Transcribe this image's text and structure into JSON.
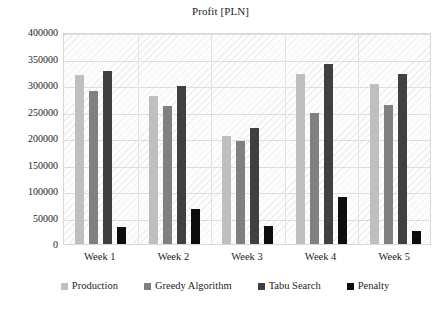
{
  "chart_data": {
    "type": "bar",
    "title": "Profit [PLN]",
    "xlabel": "",
    "ylabel": "",
    "categories": [
      "Week 1",
      "Week 2",
      "Week 3",
      "Week 4",
      "Week 5"
    ],
    "series": [
      {
        "name": "Production",
        "color": "#bfbfbf",
        "values": [
          318000,
          280000,
          203000,
          320000,
          302000
        ]
      },
      {
        "name": "Greedy Algorithm",
        "color": "#808080",
        "values": [
          289000,
          261000,
          194000,
          247000,
          262000
        ]
      },
      {
        "name": "Tabu Search",
        "color": "#404040",
        "values": [
          326000,
          299000,
          219000,
          340000,
          321000
        ]
      },
      {
        "name": "Penalty",
        "color": "#0d0d0d",
        "values": [
          33000,
          66000,
          34000,
          88000,
          24000
        ]
      }
    ],
    "ylim": [
      0,
      400000
    ],
    "ytick_step": 50000,
    "ytick_labels": [
      "400000",
      "350000",
      "300000",
      "250000",
      "200000",
      "150000",
      "100000",
      "50000",
      "0"
    ],
    "ytick_values": [
      400000,
      350000,
      300000,
      250000,
      200000,
      150000,
      100000,
      50000,
      0
    ],
    "grid": true,
    "legend_position": "bottom",
    "plot_background": "hatched-diagonal"
  }
}
